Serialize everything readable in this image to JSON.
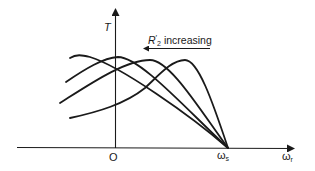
{
  "diagram": {
    "axes": {
      "y_label": "T",
      "x_label_main": "ω",
      "x_label_sub": "r",
      "origin_label": "O",
      "sync_label_main": "ω",
      "sync_label_sub": "s"
    },
    "annotation": {
      "symbol_main": "R",
      "symbol_prime": "′",
      "symbol_sub": "2",
      "text": " increasing",
      "arrow_direction": "left"
    },
    "curves": [
      {
        "name": "curve-1",
        "order": "largest R2'",
        "peak_x": 85
      },
      {
        "name": "curve-2",
        "order": "",
        "peak_x": 118
      },
      {
        "name": "curve-3",
        "order": "",
        "peak_x": 150
      },
      {
        "name": "curve-4",
        "order": "smallest R2'",
        "peak_x": 185
      }
    ],
    "colors": {
      "ink": "#1a1a1a",
      "background": "#ffffff"
    }
  }
}
